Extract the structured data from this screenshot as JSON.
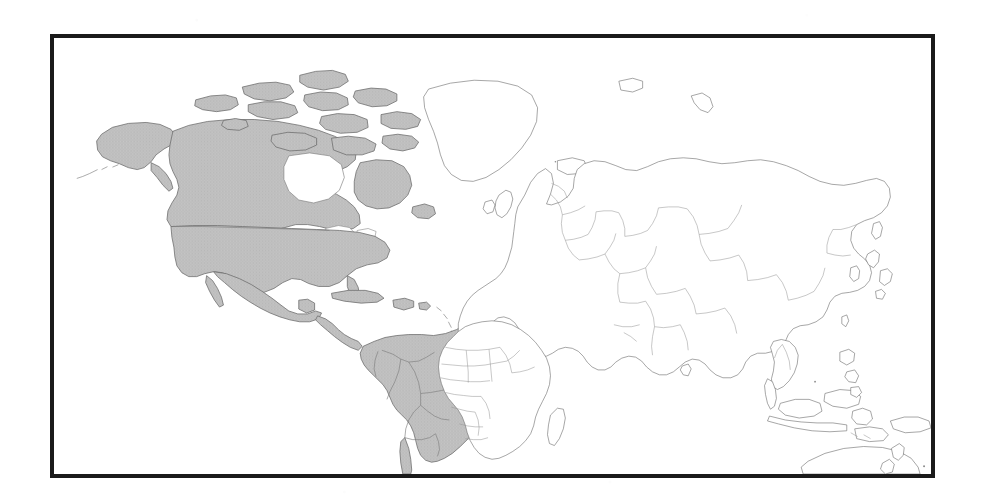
{
  "figure": {
    "kind": "world-map",
    "caption": "",
    "projection": "equirectangular-plate-carree",
    "frame": {
      "border_color": "#1a1a1a",
      "border_width_px": 4,
      "left_px": 50,
      "top_px": 34,
      "width_px": 885,
      "height_px": 444
    },
    "background_color": "#ffffff"
  },
  "legend": {
    "highlight_label": "",
    "highlight_color": "#bdbdbd",
    "outline_color": "#7a7a7a",
    "unhighlighted_color": "#ffffff"
  },
  "map_data": {
    "type": "choropleth-binary",
    "ocean_color": "#ffffff",
    "coastline_color": "#6f6f6f",
    "border_color": "#8a8a8a",
    "highlighted_fill": "#bdbdbd",
    "unhighlighted_fill": "#ffffff",
    "highlighted_regions": [
      "Alaska",
      "Canada",
      "Canadian Arctic Archipelago",
      "United States",
      "Mexico",
      "Guatemala",
      "Belize",
      "Honduras",
      "El Salvador",
      "Nicaragua",
      "Costa Rica",
      "Panama",
      "Cuba",
      "Hispaniola",
      "Jamaica",
      "Puerto Rico",
      "Colombia",
      "Venezuela",
      "Guyana",
      "Suriname",
      "French Guiana",
      "Ecuador",
      "Peru",
      "Bolivia",
      "Brazil",
      "Paraguay",
      "Uruguay",
      "Argentina",
      "Chile"
    ],
    "unhighlighted_regions": [
      "Greenland",
      "Iceland",
      "United Kingdom",
      "Ireland",
      "Norway",
      "Sweden",
      "Finland",
      "Denmark",
      "Germany",
      "France",
      "Spain",
      "Portugal",
      "Italy",
      "Poland",
      "Ukraine",
      "Russia",
      "Turkey",
      "Kazakhstan",
      "China",
      "Mongolia",
      "Japan",
      "Korea",
      "India",
      "Pakistan",
      "Iran",
      "Saudi Arabia",
      "Egypt",
      "Libya",
      "Algeria",
      "Morocco",
      "Mali",
      "Niger",
      "Chad",
      "Sudan",
      "Ethiopia",
      "Nigeria",
      "Democratic Republic of the Congo",
      "Angola",
      "Zambia",
      "Tanzania",
      "Namibia",
      "Botswana",
      "South Africa",
      "Madagascar",
      "Thailand",
      "Vietnam",
      "Myanmar",
      "Malaysia",
      "Indonesia",
      "Philippines",
      "Papua New Guinea",
      "Australia",
      "New Zealand"
    ],
    "internal_borders_shown": true,
    "graticule_shown": false,
    "labels_shown": false
  }
}
